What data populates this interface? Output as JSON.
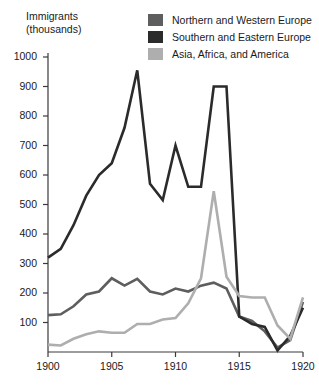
{
  "chart_data": {
    "type": "line",
    "title": "",
    "ylabel": "Immigrants\n(thousands)",
    "xlabel": "",
    "xlim": [
      1900,
      1920
    ],
    "ylim": [
      0,
      1050
    ],
    "grid": false,
    "legend_position": "top-right",
    "yticks": [
      100,
      200,
      300,
      400,
      500,
      600,
      700,
      800,
      900,
      1000
    ],
    "xticks": [
      1900,
      1905,
      1910,
      1915,
      1920
    ],
    "x": [
      1900,
      1901,
      1902,
      1903,
      1904,
      1905,
      1906,
      1907,
      1908,
      1909,
      1910,
      1911,
      1912,
      1913,
      1914,
      1915,
      1916,
      1917,
      1918,
      1919,
      1920
    ],
    "series": [
      {
        "name": "Northern and Western Europe",
        "color": "#5e5e5e",
        "values": [
          125,
          128,
          155,
          195,
          205,
          250,
          225,
          248,
          205,
          195,
          215,
          205,
          225,
          235,
          215,
          120,
          105,
          70,
          15,
          40,
          170
        ]
      },
      {
        "name": "Southern and Eastern Europe",
        "color": "#2b2b2b",
        "values": [
          320,
          350,
          430,
          530,
          600,
          640,
          760,
          955,
          570,
          515,
          700,
          560,
          560,
          900,
          900,
          120,
          95,
          85,
          5,
          55,
          150
        ]
      },
      {
        "name": "Asia, Africa, and America",
        "color": "#aeaeae",
        "values": [
          25,
          22,
          45,
          60,
          70,
          65,
          65,
          95,
          95,
          110,
          115,
          165,
          250,
          545,
          255,
          190,
          185,
          185,
          90,
          45,
          185
        ]
      }
    ]
  }
}
